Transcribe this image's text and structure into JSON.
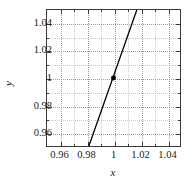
{
  "chart_data": {
    "type": "line",
    "title": "",
    "subtitle": "",
    "xlabel": "x",
    "ylabel": "y",
    "xlim": [
      0.95,
      1.05
    ],
    "ylim": [
      0.95,
      1.05
    ],
    "xticks": [
      0.96,
      0.98,
      1,
      1.02,
      1.04
    ],
    "xticklabels": [
      "0.96",
      "0.98",
      "1",
      "1.02",
      "1.04"
    ],
    "yticks": [
      0.96,
      0.98,
      1,
      1.02,
      1.04
    ],
    "yticklabels": [
      "0.96",
      "0.98",
      "1",
      "1.02",
      "1.04"
    ],
    "minor_ticks": true,
    "grid": true,
    "grid_style": "dotted",
    "legend": null,
    "series": [
      {
        "name": "line",
        "type": "line",
        "color": "#000000",
        "linewidth": 1.3,
        "x": [
          0.9815,
          1.0175
        ],
        "y": [
          0.95,
          1.05
        ]
      },
      {
        "name": "marker",
        "type": "scatter",
        "color": "#000000",
        "marker": "filled-circle",
        "markersize": 5,
        "x": [
          1.0
        ],
        "y": [
          1.0
        ]
      }
    ],
    "annotations": []
  },
  "axes": {
    "x_axis_name": "x-axis",
    "y_axis_name": "y-axis"
  }
}
